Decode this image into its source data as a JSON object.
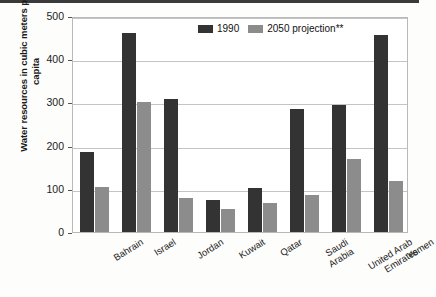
{
  "chart_data": {
    "type": "bar",
    "title": "",
    "xlabel": "",
    "ylabel": "Water resources in cubic meters per capita",
    "ylim": [
      0,
      500
    ],
    "yticks": [
      0,
      100,
      200,
      300,
      400,
      500
    ],
    "grid": true,
    "legend_position": "top-center",
    "categories": [
      "Bahrain",
      "Israel",
      "Jordan",
      "Kuwait",
      "Qatar",
      "Saudi\nArabia",
      "United Arab\nEmirates",
      "Yemen"
    ],
    "series": [
      {
        "name": "1990",
        "color": "#333333",
        "values": [
          185,
          460,
          308,
          75,
          103,
          285,
          293,
          457
        ]
      },
      {
        "name": "2050 projection**",
        "color": "#8c8c8c",
        "values": [
          105,
          300,
          78,
          53,
          67,
          85,
          168,
          118
        ]
      }
    ]
  },
  "legend": {
    "items": [
      {
        "label": "1990"
      },
      {
        "label": "2050 projection**"
      }
    ]
  },
  "axis": {
    "y_title": "Water resources in cubic meters per capita",
    "y_tick_labels": [
      "500",
      "400",
      "300",
      "200",
      "100",
      "0"
    ]
  },
  "colors": {
    "series_1990": "#333333",
    "series_2050": "#8c8c8c",
    "grid": "#c4c4c4",
    "frame": "#b9b9b9",
    "top_rule": "#3a3a3a"
  }
}
